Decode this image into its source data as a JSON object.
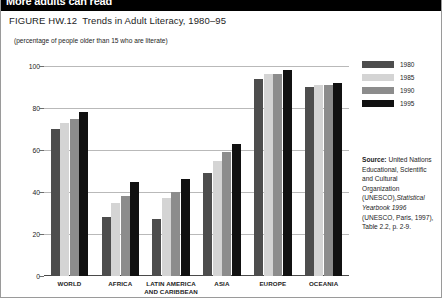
{
  "banner": {
    "headline": "More adults can read"
  },
  "figure": {
    "number": "FIGURE HW.12",
    "title": "Trends in Adult Literacy, 1980–95",
    "subtitle": "(percentage of people older than 15 who are literate)"
  },
  "legend": {
    "position": "right",
    "items": [
      {
        "label": "1980",
        "color": "#4d4d4d"
      },
      {
        "label": "1985",
        "color": "#d4d4d4"
      },
      {
        "label": "1990",
        "color": "#8c8c8c"
      },
      {
        "label": "1995",
        "color": "#111111"
      }
    ]
  },
  "source": {
    "label": "Source:",
    "text": " United Nations Educational, Scientific and Cultural Organization (UNESCO),",
    "italic": "Statistical Yearbook 1996",
    "text2": " (UNESCO, Paris, 1997), Table 2.2, p. 2-9."
  },
  "chart_data": {
    "type": "bar",
    "title": "Trends in Adult Literacy, 1980–95",
    "subtitle": "(percentage of people older than 15 who are literate)",
    "xlabel": "",
    "ylabel": "",
    "ylim": [
      0,
      100
    ],
    "yticks": [
      0,
      20,
      40,
      60,
      80,
      100
    ],
    "grid": true,
    "legend_position": "right",
    "categories": [
      "WORLD",
      "AFRICA",
      "LATIN AMERICA AND CARIBBEAN",
      "ASIA",
      "EUROPE",
      "OCEANIA"
    ],
    "category_labels": [
      [
        "WORLD"
      ],
      [
        "AFRICA"
      ],
      [
        "LATIN AMERICA",
        "AND CARIBBEAN"
      ],
      [
        "ASIA"
      ],
      [
        "EUROPE"
      ],
      [
        "OCEANIA"
      ]
    ],
    "series": [
      {
        "name": "1980",
        "color": "#4d4d4d",
        "values": [
          70,
          28,
          27,
          49,
          94,
          90
        ]
      },
      {
        "name": "1985",
        "color": "#d4d4d4",
        "values": [
          73,
          35,
          37,
          55,
          96,
          91
        ]
      },
      {
        "name": "1990",
        "color": "#8c8c8c",
        "values": [
          75,
          38,
          40,
          59,
          96,
          91
        ]
      },
      {
        "name": "1995",
        "color": "#111111",
        "values": [
          78,
          45,
          46,
          63,
          98,
          92
        ]
      }
    ]
  }
}
